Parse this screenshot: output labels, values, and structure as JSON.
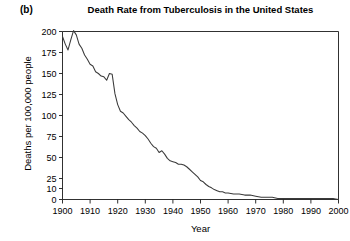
{
  "panel": {
    "label": "(b)"
  },
  "chart_data": {
    "type": "line",
    "title": "Death Rate from Tuberculosis in the United States",
    "xlabel": "Year",
    "ylabel": "Deaths per 100,000 people",
    "grid": false,
    "legend": null,
    "xlim": [
      1900,
      2000
    ],
    "ylim": [
      0,
      200
    ],
    "xticks": [
      1900,
      1910,
      1920,
      1930,
      1940,
      1950,
      1960,
      1970,
      1980,
      1990,
      2000
    ],
    "xtick_labels": [
      "1900",
      "1910",
      "1920",
      "1930",
      "1940",
      "1950",
      "1960",
      "1970",
      "1980",
      "1990",
      "2000"
    ],
    "yticks": [
      0,
      10,
      25,
      50,
      75,
      100,
      125,
      150,
      175,
      200
    ],
    "ytick_labels": [
      "0",
      "10",
      "25",
      "50",
      "75",
      "100",
      "125",
      "150",
      "175",
      "200"
    ],
    "y_scale_note": "piecewise: 0-10 and 10-25 compressed relative to 25-200 linear spacing",
    "series": [
      {
        "name": "Tuberculosis death rate",
        "x": [
          1900,
          1901,
          1902,
          1903,
          1904,
          1905,
          1906,
          1907,
          1908,
          1909,
          1910,
          1911,
          1912,
          1913,
          1914,
          1915,
          1916,
          1917,
          1918,
          1919,
          1920,
          1921,
          1922,
          1923,
          1924,
          1925,
          1926,
          1927,
          1928,
          1929,
          1930,
          1931,
          1932,
          1933,
          1934,
          1935,
          1936,
          1937,
          1938,
          1939,
          1940,
          1941,
          1942,
          1943,
          1944,
          1945,
          1946,
          1947,
          1948,
          1949,
          1950,
          1951,
          1952,
          1953,
          1954,
          1955,
          1956,
          1957,
          1958,
          1959,
          1960,
          1962,
          1964,
          1966,
          1968,
          1970,
          1972,
          1974,
          1976,
          1978,
          1980,
          1982,
          1984,
          1986,
          1988,
          1990,
          1992,
          1994,
          1996,
          1998,
          2000
        ],
        "values": [
          194,
          185,
          178,
          190,
          201,
          196,
          185,
          180,
          172,
          167,
          161,
          159,
          152,
          150,
          147,
          146,
          142,
          150,
          149,
          126,
          113,
          105,
          103,
          99,
          95,
          92,
          88,
          85,
          81,
          79,
          76,
          72,
          67,
          63,
          61,
          56,
          58,
          54,
          49,
          46,
          45,
          44,
          42,
          42,
          41,
          39,
          36,
          33,
          30,
          27,
          22,
          20,
          16,
          13,
          11,
          9,
          8,
          7,
          7,
          6,
          6,
          5,
          5,
          4,
          4,
          3,
          2,
          2,
          2,
          1,
          1,
          1,
          1,
          1,
          1,
          1,
          1,
          1,
          1,
          1,
          0
        ]
      }
    ]
  }
}
